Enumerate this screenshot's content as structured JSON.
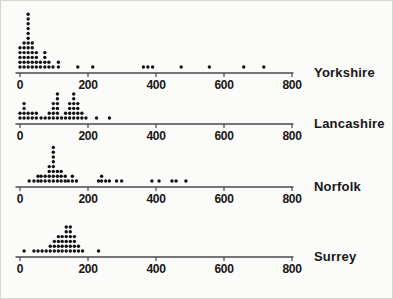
{
  "figure": {
    "background": "#fbfbf9",
    "ink": "#111111",
    "axis_color": "#4a4a4a",
    "label_color": "#161616"
  },
  "chart_data": {
    "type": "dotplot",
    "title": "",
    "xlabel": "",
    "ylabel": "",
    "x_axis": {
      "min": 0,
      "max": 800,
      "ticks": [
        0,
        200,
        400,
        600,
        800
      ],
      "tick_labels": [
        "0",
        "200",
        "400",
        "600",
        "800"
      ],
      "grid": false
    },
    "legend": "none",
    "panels": [
      {
        "label": "Yorkshire",
        "columns": [
          [
            0,
            5
          ],
          [
            12,
            6
          ],
          [
            24,
            12
          ],
          [
            36,
            6
          ],
          [
            48,
            4
          ],
          [
            60,
            2
          ],
          [
            73,
            4
          ],
          [
            85,
            2
          ],
          [
            97,
            1
          ],
          [
            113,
            2
          ],
          [
            170,
            1
          ],
          [
            214,
            1
          ],
          [
            363,
            1
          ],
          [
            376,
            1
          ],
          [
            390,
            1
          ],
          [
            474,
            1
          ],
          [
            557,
            1
          ],
          [
            658,
            1
          ],
          [
            717,
            1
          ]
        ]
      },
      {
        "label": "Lancashire",
        "columns": [
          [
            0,
            2
          ],
          [
            12,
            4
          ],
          [
            24,
            2
          ],
          [
            36,
            2
          ],
          [
            48,
            2
          ],
          [
            62,
            1
          ],
          [
            74,
            1
          ],
          [
            86,
            2
          ],
          [
            98,
            4
          ],
          [
            110,
            6
          ],
          [
            122,
            1
          ],
          [
            134,
            2
          ],
          [
            146,
            4
          ],
          [
            158,
            6
          ],
          [
            170,
            4
          ],
          [
            182,
            2
          ],
          [
            194,
            1
          ],
          [
            225,
            1
          ],
          [
            263,
            1
          ]
        ]
      },
      {
        "label": "Norfolk",
        "columns": [
          [
            27,
            1
          ],
          [
            41,
            1
          ],
          [
            53,
            2
          ],
          [
            62,
            2
          ],
          [
            74,
            2
          ],
          [
            86,
            4
          ],
          [
            98,
            8
          ],
          [
            110,
            3
          ],
          [
            121,
            3
          ],
          [
            133,
            2
          ],
          [
            142,
            1
          ],
          [
            154,
            2
          ],
          [
            166,
            1
          ],
          [
            231,
            1
          ],
          [
            240,
            2
          ],
          [
            252,
            1
          ],
          [
            263,
            1
          ],
          [
            284,
            1
          ],
          [
            299,
            1
          ],
          [
            388,
            1
          ],
          [
            409,
            1
          ],
          [
            447,
            1
          ],
          [
            459,
            1
          ],
          [
            488,
            1
          ]
        ]
      },
      {
        "label": "Surrey",
        "columns": [
          [
            12,
            1
          ],
          [
            41,
            1
          ],
          [
            53,
            1
          ],
          [
            65,
            1
          ],
          [
            77,
            1
          ],
          [
            89,
            2
          ],
          [
            101,
            3
          ],
          [
            113,
            4
          ],
          [
            124,
            4
          ],
          [
            136,
            6
          ],
          [
            148,
            6
          ],
          [
            160,
            4
          ],
          [
            172,
            2
          ],
          [
            184,
            1
          ],
          [
            231,
            1
          ]
        ]
      }
    ]
  }
}
